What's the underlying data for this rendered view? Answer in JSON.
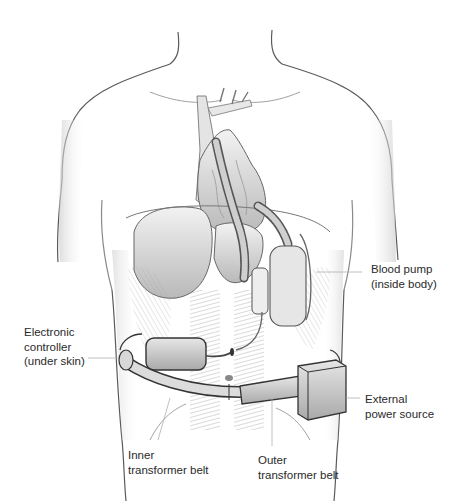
{
  "figure": {
    "colors": {
      "background": "#ffffff",
      "skin_line": "#4a4a4a",
      "shading": "#9a9a9a",
      "device": "#6e6e6e",
      "label_text": "#2a2a2a",
      "leader_line": "#b0b0b0"
    }
  },
  "labels": [
    {
      "id": "blood-pump",
      "line1": "Blood pump",
      "line2": "(inside body)"
    },
    {
      "id": "electronic-controller",
      "line1": "Electronic",
      "line2": "controller",
      "line3": "(under skin)"
    },
    {
      "id": "external-power",
      "line1": "External",
      "line2": "power source"
    },
    {
      "id": "inner-belt",
      "line1": "Inner",
      "line2": "transformer belt"
    },
    {
      "id": "outer-belt",
      "line1": "Outer",
      "line2": "transformer belt"
    }
  ]
}
